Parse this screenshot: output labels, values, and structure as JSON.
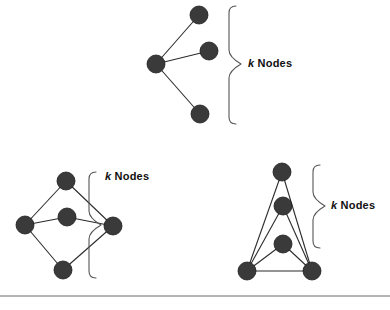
{
  "figure": {
    "background_color": "#ffffff",
    "node_color": "#3a3a3a",
    "edge_color": "#2b2b2b",
    "brace_color": "#555555",
    "rule_color": "#6b6b6b"
  },
  "labels": {
    "k_symbol": "k",
    "nodes_word": "Nodes",
    "full_text": "k Nodes"
  },
  "panels": [
    {
      "id": "top-fan",
      "name": "fan-graph",
      "node_count": 4,
      "nodes": [
        {
          "id": "hub",
          "cx": 156,
          "cy": 64,
          "r": 9
        },
        {
          "id": "upper",
          "cx": 199,
          "cy": 15,
          "r": 9
        },
        {
          "id": "mid",
          "cx": 209,
          "cy": 51,
          "r": 9
        },
        {
          "id": "lower",
          "cx": 200,
          "cy": 114,
          "r": 9
        }
      ],
      "edges": [
        {
          "from": "hub",
          "to": "upper"
        },
        {
          "from": "hub",
          "to": "mid"
        },
        {
          "from": "hub",
          "to": "lower"
        }
      ],
      "brace": {
        "x": 229,
        "y_top": 6,
        "y_bottom": 124,
        "tip_x": 241,
        "tip_y": 64
      },
      "label_pos": {
        "left": 248,
        "top": 57
      }
    },
    {
      "id": "bottom-left-diamond",
      "name": "diamond-graph",
      "node_count": 5,
      "nodes": [
        {
          "id": "top",
          "cx": 66,
          "cy": 181,
          "r": 9
        },
        {
          "id": "left",
          "cx": 25,
          "cy": 225,
          "r": 9
        },
        {
          "id": "center",
          "cx": 67,
          "cy": 217,
          "r": 9
        },
        {
          "id": "right",
          "cx": 113,
          "cy": 226,
          "r": 9
        },
        {
          "id": "bottom",
          "cx": 63,
          "cy": 270,
          "r": 9
        }
      ],
      "edges": [
        {
          "from": "top",
          "to": "left"
        },
        {
          "from": "top",
          "to": "right"
        },
        {
          "from": "left",
          "to": "center"
        },
        {
          "from": "center",
          "to": "right"
        },
        {
          "from": "left",
          "to": "bottom"
        },
        {
          "from": "bottom",
          "to": "right"
        }
      ],
      "brace": {
        "x": 89,
        "y_top": 172,
        "y_bottom": 278,
        "tip_x": 101,
        "tip_y": 225
      },
      "label_pos": {
        "left": 105,
        "top": 170
      }
    },
    {
      "id": "bottom-right-fan",
      "name": "stacked-fan-graph",
      "node_count": 5,
      "nodes": [
        {
          "id": "n1",
          "cx": 282,
          "cy": 172,
          "r": 9
        },
        {
          "id": "n2",
          "cx": 283,
          "cy": 206,
          "r": 9
        },
        {
          "id": "n3",
          "cx": 283,
          "cy": 244,
          "r": 9
        },
        {
          "id": "baseL",
          "cx": 247,
          "cy": 271,
          "r": 9
        },
        {
          "id": "baseR",
          "cx": 312,
          "cy": 271,
          "r": 9
        }
      ],
      "edges": [
        {
          "from": "baseL",
          "to": "n1"
        },
        {
          "from": "baseL",
          "to": "n2"
        },
        {
          "from": "baseL",
          "to": "n3"
        },
        {
          "from": "baseR",
          "to": "n1"
        },
        {
          "from": "baseR",
          "to": "n2"
        },
        {
          "from": "baseR",
          "to": "n3"
        },
        {
          "from": "baseL",
          "to": "baseR"
        }
      ],
      "brace": {
        "x": 313,
        "y_top": 165,
        "y_bottom": 248,
        "tip_x": 325,
        "tip_y": 206
      },
      "label_pos": {
        "left": 331,
        "top": 199
      }
    }
  ],
  "rule": {
    "x1": 0,
    "y1": 296,
    "x2": 390,
    "y2": 296
  }
}
